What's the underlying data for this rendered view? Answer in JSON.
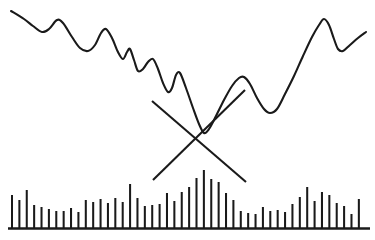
{
  "chart_data": {
    "type": "line",
    "title": "",
    "subtitle": "",
    "xlabel": "",
    "ylabel": "",
    "grid": false,
    "legend": false,
    "axis_ranges": {
      "x": [
        0,
        375
      ],
      "y_price": [
        0,
        190
      ],
      "y_volume": [
        0,
        240
      ]
    },
    "annotations": [
      {
        "name": "downtrend-line",
        "type": "trendline",
        "direction": "down",
        "points": [
          [
            152,
            101
          ],
          [
            246,
            182
          ]
        ]
      },
      {
        "name": "uptrend-line",
        "type": "trendline",
        "direction": "up",
        "points": [
          [
            153,
            180
          ],
          [
            245,
            90
          ]
        ]
      }
    ],
    "series": [
      {
        "name": "price",
        "type": "line",
        "color": "#1a1a1a",
        "points": [
          [
            11,
            11
          ],
          [
            24,
            19
          ],
          [
            33,
            26
          ],
          [
            42,
            32
          ],
          [
            49,
            29
          ],
          [
            57,
            20
          ],
          [
            63,
            23
          ],
          [
            72,
            37
          ],
          [
            80,
            48
          ],
          [
            88,
            51
          ],
          [
            95,
            45
          ],
          [
            101,
            33
          ],
          [
            106,
            29
          ],
          [
            112,
            38
          ],
          [
            118,
            52
          ],
          [
            123,
            59
          ],
          [
            127,
            52
          ],
          [
            130,
            49
          ],
          [
            134,
            60
          ],
          [
            138,
            71
          ],
          [
            143,
            69
          ],
          [
            148,
            62
          ],
          [
            153,
            59
          ],
          [
            158,
            69
          ],
          [
            163,
            83
          ],
          [
            168,
            92
          ],
          [
            172,
            88
          ],
          [
            176,
            75
          ],
          [
            180,
            73
          ],
          [
            186,
            88
          ],
          [
            193,
            108
          ],
          [
            199,
            124
          ],
          [
            204,
            133
          ],
          [
            209,
            129
          ],
          [
            216,
            116
          ],
          [
            224,
            100
          ],
          [
            232,
            86
          ],
          [
            239,
            78
          ],
          [
            244,
            77
          ],
          [
            250,
            84
          ],
          [
            257,
            98
          ],
          [
            264,
            109
          ],
          [
            270,
            113
          ],
          [
            277,
            109
          ],
          [
            285,
            94
          ],
          [
            294,
            76
          ],
          [
            303,
            56
          ],
          [
            312,
            37
          ],
          [
            319,
            25
          ],
          [
            324,
            19
          ],
          [
            329,
            25
          ],
          [
            334,
            39
          ],
          [
            338,
            49
          ],
          [
            343,
            51
          ],
          [
            350,
            45
          ],
          [
            358,
            38
          ],
          [
            366,
            32
          ]
        ]
      },
      {
        "name": "volume",
        "type": "bar",
        "color": "#1a1a1a",
        "baseline_y": 228,
        "bar_x_start": 12,
        "bar_spacing": 7.38,
        "bar_width": 2.05,
        "heights": [
          33,
          28,
          38,
          23,
          21,
          19,
          17,
          17,
          20,
          16,
          28,
          26,
          29,
          25,
          30,
          26,
          44,
          30,
          22,
          23,
          24,
          35,
          27,
          36,
          41,
          50,
          58,
          49,
          46,
          35,
          28,
          17,
          15,
          14,
          21,
          17,
          18,
          16,
          24,
          31,
          41,
          27,
          36,
          33,
          25,
          22,
          14,
          29
        ]
      }
    ]
  },
  "canvas": {
    "background": "#ffffff",
    "stroke": "#1a1a1a",
    "width": 375,
    "height": 240
  }
}
